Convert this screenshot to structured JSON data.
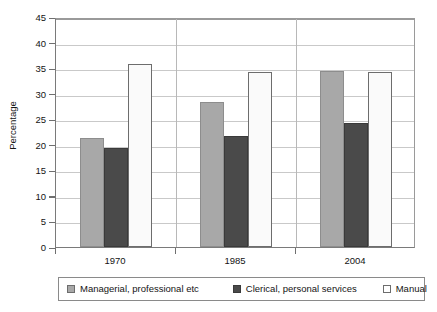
{
  "chart_data": {
    "type": "bar",
    "title": "",
    "xlabel": "",
    "ylabel": "Percentage",
    "categories": [
      "1970",
      "1985",
      "2004"
    ],
    "series": [
      {
        "name": "Managerial, professional etc",
        "color": "#a8a8a8",
        "values": [
          21.4,
          28.4,
          34.5
        ]
      },
      {
        "name": "Clerical, personal services",
        "color": "#4a4a4a",
        "values": [
          19.4,
          21.7,
          24.3
        ]
      },
      {
        "name": "Manual",
        "color": "#fafafa",
        "values": [
          35.8,
          34.3,
          34.2
        ]
      }
    ],
    "ylim": [
      0,
      45
    ],
    "yticks": [
      "0",
      "5",
      "10",
      "15",
      "20",
      "25",
      "30",
      "35",
      "40",
      "45"
    ],
    "grid": true,
    "legend_position": "bottom"
  },
  "axis": {
    "y_title": "Percentage"
  }
}
